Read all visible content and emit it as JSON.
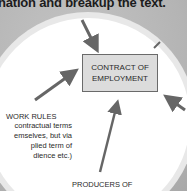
{
  "heading": {
    "text": "nation and breakup the text."
  },
  "diagram": {
    "center_box": {
      "line1": "CONTRACT OF",
      "line2": "EMPLOYMENT"
    },
    "work_rules": {
      "title": "WORK RULES",
      "desc_lines": [
        "contractual terms",
        "emselves, but via",
        "plied term of",
        "dience etc.)"
      ]
    },
    "producers": {
      "text": "PRODUCERS OF"
    }
  },
  "colors": {
    "arrow": "#666666",
    "box_fill": "#dcdcdc",
    "background": "#b9b9b9"
  }
}
